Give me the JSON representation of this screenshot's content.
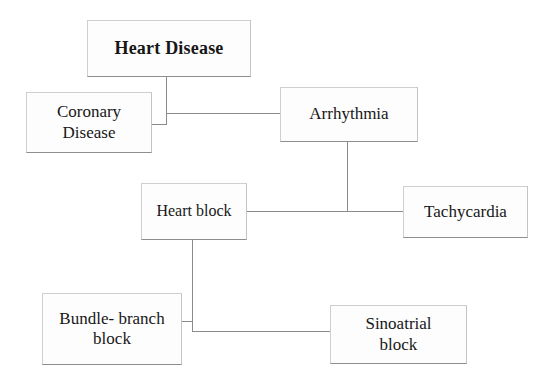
{
  "diagram": {
    "title": "Heart Disease",
    "type": "hierarchy-flowchart",
    "background_color": "#ffffff",
    "line_color": "#8b8b8b",
    "box_border_color": "#b9b9b9",
    "box_fill_color": "#fdfdfd",
    "text_color": "#171717",
    "nodes": [
      {
        "id": "heart-disease",
        "label": "Heart Disease",
        "level": 0,
        "bold": true
      },
      {
        "id": "coronary-disease",
        "label": "Coronary\nDisease",
        "level": 1,
        "bold": false
      },
      {
        "id": "arrhythmia",
        "label": "Arrhythmia",
        "level": 1,
        "bold": false
      },
      {
        "id": "heart-block",
        "label": "Heart block",
        "level": 2,
        "bold": false
      },
      {
        "id": "tachycardia",
        "label": "Tachycardia",
        "level": 2,
        "bold": false
      },
      {
        "id": "bundle-branch-block",
        "label": "Bundle- branch\nblock",
        "level": 3,
        "bold": false
      },
      {
        "id": "sinoatrial-block",
        "label": "Sinoatrial\nblock",
        "level": 3,
        "bold": false
      }
    ],
    "edges": [
      {
        "from": "heart-disease",
        "to": "coronary-disease"
      },
      {
        "from": "heart-disease",
        "to": "arrhythmia"
      },
      {
        "from": "arrhythmia",
        "to": "heart-block"
      },
      {
        "from": "arrhythmia",
        "to": "tachycardia"
      },
      {
        "from": "heart-block",
        "to": "bundle-branch-block"
      },
      {
        "from": "heart-block",
        "to": "sinoatrial-block"
      }
    ]
  }
}
